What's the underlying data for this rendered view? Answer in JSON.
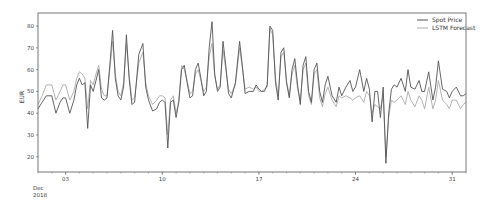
{
  "chart_data": {
    "type": "line",
    "title": "",
    "xlabel": "",
    "ylabel": "EUR",
    "x_tick_labels": [
      "03",
      "10",
      "17",
      "24",
      "31"
    ],
    "x_tick_days": [
      3,
      10,
      17,
      24,
      31
    ],
    "x_month_label": "Dec",
    "x_year_label": "2018",
    "xlim_days": [
      1,
      32
    ],
    "y_ticks": [
      20,
      30,
      40,
      50,
      60,
      70,
      80
    ],
    "ylim": [
      13,
      86
    ],
    "grid": false,
    "legend_position": "upper right",
    "x_days": [
      1.0,
      1.3,
      1.6,
      2.0,
      2.3,
      2.6,
      2.8,
      3.0,
      3.3,
      3.6,
      3.8,
      4.0,
      4.2,
      4.4,
      4.6,
      4.8,
      5.0,
      5.2,
      5.4,
      5.6,
      5.8,
      6.0,
      6.2,
      6.4,
      6.6,
      6.8,
      7.0,
      7.2,
      7.4,
      7.6,
      7.8,
      8.0,
      8.3,
      8.6,
      8.8,
      9.0,
      9.3,
      9.6,
      9.8,
      10.0,
      10.2,
      10.4,
      10.6,
      10.8,
      11.0,
      11.2,
      11.4,
      11.6,
      11.8,
      12.0,
      12.2,
      12.4,
      12.6,
      12.8,
      13.0,
      13.2,
      13.4,
      13.6,
      13.8,
      14.0,
      14.2,
      14.4,
      14.6,
      14.8,
      15.0,
      15.3,
      15.6,
      15.8,
      16.0,
      16.3,
      16.6,
      16.8,
      17.0,
      17.2,
      17.4,
      17.6,
      17.8,
      18.0,
      18.2,
      18.4,
      18.6,
      18.8,
      19.0,
      19.2,
      19.4,
      19.6,
      19.8,
      20.0,
      20.2,
      20.4,
      20.6,
      20.8,
      21.0,
      21.2,
      21.4,
      21.6,
      21.8,
      22.0,
      22.3,
      22.6,
      22.8,
      23.0,
      23.3,
      23.6,
      23.8,
      24.0,
      24.3,
      24.6,
      24.8,
      25.0,
      25.2,
      25.4,
      25.6,
      25.8,
      26.0,
      26.2,
      26.4,
      26.6,
      26.8,
      27.0,
      27.3,
      27.6,
      27.8,
      28.0,
      28.3,
      28.6,
      28.8,
      29.0,
      29.3,
      29.6,
      29.8,
      30.0,
      30.3,
      30.6,
      30.8,
      31.0,
      31.3,
      31.6,
      31.8,
      32.0
    ],
    "series": [
      {
        "name": "Spot Price",
        "color": "#555555",
        "values": [
          42,
          45,
          48,
          48,
          40,
          45,
          47,
          47,
          40,
          46,
          53,
          56,
          53,
          54,
          33,
          53,
          50,
          55,
          60,
          47,
          46,
          47,
          62,
          78,
          56,
          48,
          46,
          52,
          76,
          56,
          44,
          45,
          67,
          72,
          52,
          46,
          41,
          42,
          45,
          46,
          45,
          24,
          45,
          46,
          38,
          45,
          60,
          62,
          54,
          47,
          48,
          60,
          63,
          56,
          48,
          50,
          70,
          82,
          58,
          50,
          52,
          73,
          62,
          49,
          47,
          54,
          73,
          62,
          49,
          50,
          50,
          53,
          51,
          50,
          50,
          53,
          80,
          78,
          54,
          46,
          68,
          70,
          54,
          47,
          60,
          65,
          53,
          44,
          62,
          66,
          50,
          45,
          60,
          63,
          50,
          45,
          53,
          57,
          48,
          45,
          52,
          48,
          52,
          55,
          50,
          52,
          60,
          50,
          56,
          51,
          36,
          50,
          50,
          38,
          52,
          17,
          40,
          51,
          53,
          52,
          56,
          50,
          60,
          52,
          51,
          55,
          50,
          50,
          59,
          46,
          52,
          64,
          51,
          50,
          47,
          50,
          52,
          48,
          48,
          49,
          47
        ]
      },
      {
        "name": "LSTM Forecast",
        "color": "#aaaaaa",
        "values": [
          44,
          48,
          53,
          53,
          46,
          50,
          53,
          53,
          46,
          50,
          56,
          59,
          58,
          56,
          42,
          55,
          53,
          58,
          62,
          51,
          48,
          48,
          60,
          73,
          58,
          50,
          48,
          54,
          72,
          58,
          46,
          47,
          63,
          68,
          54,
          48,
          44,
          46,
          48,
          48,
          47,
          30,
          46,
          48,
          40,
          46,
          62,
          60,
          55,
          49,
          50,
          58,
          60,
          55,
          50,
          52,
          66,
          72,
          57,
          51,
          53,
          69,
          60,
          51,
          49,
          53,
          70,
          61,
          51,
          52,
          51,
          52,
          50,
          50,
          51,
          52,
          79,
          76,
          56,
          48,
          66,
          68,
          55,
          48,
          58,
          62,
          51,
          46,
          60,
          63,
          48,
          44,
          58,
          60,
          47,
          43,
          49,
          52,
          46,
          43,
          48,
          47,
          48,
          47,
          46,
          47,
          48,
          45,
          50,
          48,
          40,
          44,
          43,
          42,
          48,
          20,
          38,
          46,
          45,
          46,
          48,
          44,
          50,
          46,
          43,
          48,
          46,
          42,
          52,
          42,
          46,
          55,
          46,
          44,
          42,
          46,
          46,
          42,
          44,
          45,
          42
        ]
      }
    ]
  },
  "legend": {
    "items": [
      {
        "label": "Spot Price"
      },
      {
        "label": "LSTM Forecast"
      }
    ]
  }
}
